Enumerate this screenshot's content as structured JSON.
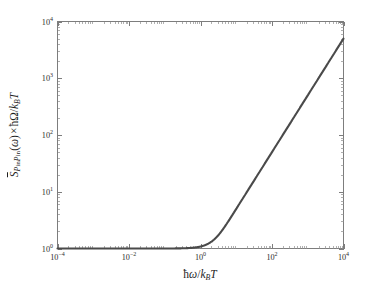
{
  "figure": {
    "background_color": "#ffffff",
    "curve_color": "#4a4a4a",
    "axis_color": "#7d7d7d"
  },
  "chart_data": {
    "type": "line",
    "title": "",
    "xlabel": "hbar*omega / (k_B*T)",
    "xlabel_display": "ħω/k_BT",
    "ylabel": "S̄_{P_in P_in}(ω) × ħΩ/k_BT",
    "xscale": "log",
    "yscale": "log",
    "xlim": [
      0.0001,
      10000
    ],
    "ylim": [
      1,
      10000
    ],
    "grid": false,
    "legend": null,
    "xticks": [
      0.0001,
      0.01,
      1,
      100,
      10000
    ],
    "xtick_labels": [
      "10⁻⁴",
      "10⁻²",
      "10⁰",
      "10²",
      "10⁴"
    ],
    "xtick_exponents": [
      "-4",
      "-2",
      "0",
      "2",
      "4"
    ],
    "yticks": [
      1,
      10,
      100,
      1000,
      10000
    ],
    "ytick_labels": [
      "10⁰",
      "10¹",
      "10²",
      "10³",
      "10⁴"
    ],
    "ytick_exponents": [
      "0",
      "1",
      "2",
      "3",
      "4"
    ],
    "minor_ticks": true,
    "series": [
      {
        "name": "S_PinPin",
        "color": "#4a4a4a",
        "linewidth": 2.1,
        "x": [
          0.0001,
          0.000178,
          0.000316,
          0.000562,
          0.001,
          0.00178,
          0.00316,
          0.00562,
          0.01,
          0.0178,
          0.0316,
          0.0562,
          0.1,
          0.178,
          0.316,
          0.562,
          1.0,
          1.33,
          1.78,
          2.37,
          3.16,
          4.22,
          5.62,
          7.5,
          10.0,
          17.8,
          31.6,
          56.2,
          100.0,
          178.0,
          316.0,
          562.0,
          1000.0,
          1780.0,
          3160.0,
          5620.0,
          10000.0
        ],
        "y": [
          1.0,
          1.0,
          1.0,
          1.0,
          1.0,
          1.0,
          1.0,
          1.0,
          1.0,
          1.0,
          1.0,
          1.0,
          1.0005,
          1.0017,
          1.0052,
          1.0163,
          1.052,
          1.088,
          1.152,
          1.255,
          1.41,
          1.65,
          2.0,
          2.52,
          3.2,
          5.35,
          9.1,
          15.8,
          27.9,
          49.4,
          87.6,
          155.6,
          276.8,
          492.6,
          874.4,
          1555.0,
          2768.0
        ],
        "endpoint_value": 2768
      }
    ]
  },
  "axis_titles": {
    "x": {
      "hbar": "ħ",
      "omega": "ω",
      "slash": "/",
      "k": "k",
      "B": "B",
      "T": "T"
    },
    "y": {
      "S": "S",
      "P": "P",
      "in": "in",
      "paren_open": "(",
      "omega": "ω",
      "paren_close": ")",
      "times": "×",
      "hbar": "ħ",
      "Omega": "Ω",
      "slash": "/",
      "k": "k",
      "B": "B",
      "T": "T"
    }
  }
}
